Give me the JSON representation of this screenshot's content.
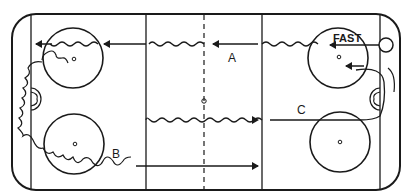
{
  "diagram": {
    "type": "hockey-rink-drill",
    "labels": {
      "a": "A",
      "b": "B",
      "c": "C",
      "fast": "FAST"
    },
    "colors": {
      "line": "#1a1a1a",
      "background": "#ffffff"
    },
    "paths": [
      {
        "id": "A",
        "description": "Skater starts at right, skates fast to left along top, wavy through neutral zone and around left faceoff circle"
      },
      {
        "id": "B",
        "description": "Wavy path from left end boards around bottom-left faceoff circle, then straight to blue line"
      },
      {
        "id": "C",
        "description": "Path from right goal area curving across to center, wavy through neutral zone"
      }
    ]
  }
}
